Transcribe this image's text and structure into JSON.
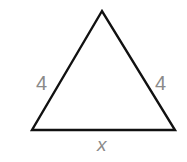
{
  "diagram": {
    "type": "isosceles-triangle",
    "stroke_color": "#111111",
    "label_color": "#8a8a8a",
    "vertices": {
      "top": [
        102,
        11
      ],
      "bottom_left": [
        32,
        130
      ],
      "bottom_right": [
        175,
        130
      ]
    },
    "labels": {
      "left_side": "4",
      "right_side": "4",
      "base": "x"
    }
  }
}
